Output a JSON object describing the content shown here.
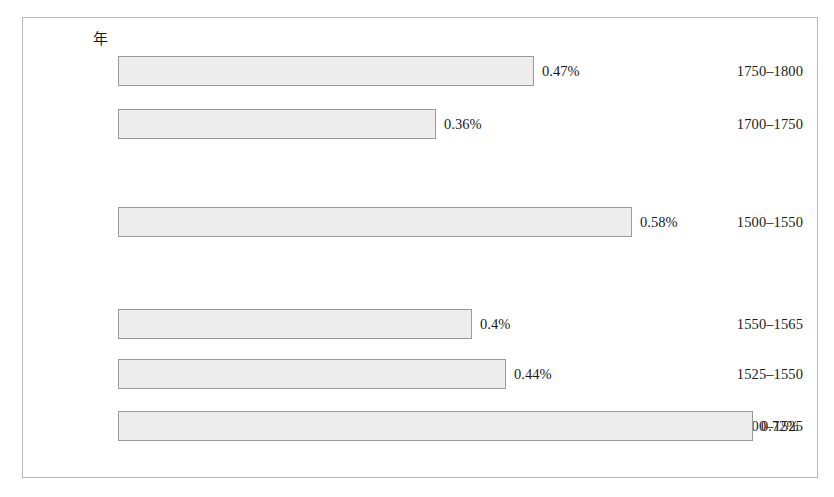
{
  "chart_data": {
    "type": "bar",
    "orientation": "horizontal",
    "title": "",
    "xlabel": "",
    "ylabel": "年",
    "categories": [
      "1750–1800",
      "1700–1750",
      "1500–1550",
      "1550–1565",
      "1525–1550",
      "1500–1525"
    ],
    "values": [
      0.47,
      0.36,
      0.58,
      0.4,
      0.44,
      0.72
    ],
    "value_labels": [
      "0.47%",
      "0.36%",
      "0.58%",
      "0.4%",
      "0.44%",
      "0.72%"
    ],
    "unit": "%",
    "xlim": [
      0,
      0.8
    ],
    "grid": false,
    "legend": false,
    "bar_fill_color": "#ededed",
    "bar_border_color": "#9a9a9a",
    "frame_border_color": "#b9b9b9"
  },
  "axis": {
    "category_header": "年"
  },
  "rows": [
    {
      "label": "1750–1800",
      "value_label": "0.47%",
      "top": 38,
      "bar_width": 416
    },
    {
      "label": "1700–1750",
      "value_label": "0.36%",
      "top": 91,
      "bar_width": 318
    },
    {
      "label": "1500–1550",
      "value_label": "0.58%",
      "top": 189,
      "bar_width": 514
    },
    {
      "label": "1550–1565",
      "value_label": "0.4%",
      "top": 291,
      "bar_width": 354
    },
    {
      "label": "1525–1550",
      "value_label": "0.44%",
      "top": 341,
      "bar_width": 388
    },
    {
      "label": "1500–1525",
      "value_label": "0.72%",
      "top": 393,
      "bar_width": 635
    }
  ]
}
